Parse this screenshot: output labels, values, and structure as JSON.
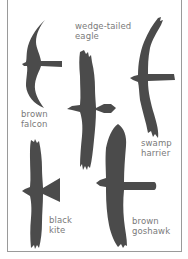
{
  "figure": {
    "title_cutoff": "",
    "silhouette_color": "#4b4b4b",
    "label_color": "#7a7a7a",
    "border_color": "#9a9a9a"
  },
  "birds": [
    {
      "id": "brown-falcon",
      "label_line1": "brown",
      "label_line2": "falcon"
    },
    {
      "id": "wedge-tailed-eagle",
      "label_line1": "wedge-tailed",
      "label_line2": "eagle"
    },
    {
      "id": "swamp-harrier",
      "label_line1": "swamp",
      "label_line2": "harrier"
    },
    {
      "id": "black-kite",
      "label_line1": "black",
      "label_line2": "kite"
    },
    {
      "id": "brown-goshawk",
      "label_line1": "brown",
      "label_line2": "goshawk"
    }
  ]
}
